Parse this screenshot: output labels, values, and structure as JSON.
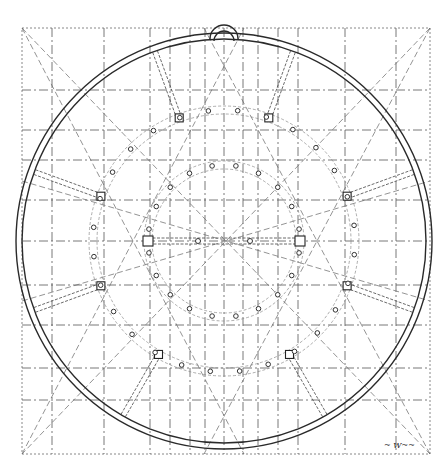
{
  "drawing": {
    "title": "circular plan with radial piers and concentric colonnades",
    "signature": "~ W~~",
    "canvas": {
      "width": 442,
      "height": 469
    },
    "center": {
      "x": 224,
      "y": 241
    },
    "frame": {
      "x1": 22,
      "y1": 28,
      "x2": 430,
      "y2": 454
    },
    "outer_wall": {
      "r_outer": 208,
      "r_inner": 202
    },
    "apse": {
      "x": 224,
      "y": 33,
      "r": 14
    },
    "middle_ring": {
      "r": 131,
      "columns": 28
    },
    "inner_ring": {
      "r": 76,
      "columns": 20
    },
    "radial_piers": [
      -70,
      -110,
      -20,
      -160,
      20,
      160,
      60,
      120
    ],
    "vertical_axes": [
      52,
      104,
      150,
      170,
      190,
      205,
      224,
      243,
      258,
      278,
      298,
      345,
      396
    ],
    "horizontal_axes": [
      90,
      130,
      160,
      200,
      241,
      285,
      325,
      368,
      400
    ],
    "colors": {
      "ink": "#2a2a2a",
      "guide": "#6a6a6a",
      "paper": "#ffffff"
    }
  }
}
